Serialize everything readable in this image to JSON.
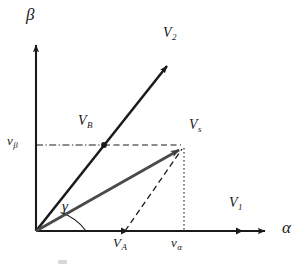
{
  "figure": {
    "kind": "space-vector-diagram",
    "background_color": "#ffffff",
    "ink_color": "#1a1a1a",
    "resultant_vector_color": "#4a4a4a"
  },
  "axes": {
    "horizontal": {
      "name": "alpha-axis",
      "label": "α",
      "origin": [
        36,
        231
      ],
      "arrow_tip": [
        272,
        231
      ],
      "label_pos": [
        282,
        222
      ]
    },
    "vertical": {
      "name": "beta-axis",
      "label": "β",
      "origin": [
        36,
        231
      ],
      "arrow_tip": [
        36,
        38
      ],
      "label_pos": [
        27,
        8
      ]
    }
  },
  "vectors": [
    {
      "name": "V2",
      "label": "V",
      "subscript": "2",
      "from": [
        36,
        231
      ],
      "to": [
        170,
        62
      ],
      "style": "solid-arrow",
      "label_pos": [
        168,
        30
      ]
    },
    {
      "name": "Vs",
      "label": "V",
      "subscript": "s",
      "from": [
        36,
        231
      ],
      "to": [
        184,
        147
      ],
      "style": "solid-arrow-gray",
      "label_pos": [
        191,
        122
      ]
    }
  ],
  "axis_markers": [
    {
      "name": "V1",
      "label": "V",
      "subscript": "1",
      "tick_pos": [
        240,
        231
      ],
      "label_pos": [
        231,
        199
      ],
      "axis": "alpha"
    },
    {
      "name": "VA",
      "label": "V",
      "subscript": "A",
      "tick_pos": [
        125,
        231
      ],
      "label_pos": [
        116,
        239
      ],
      "axis": "alpha"
    },
    {
      "name": "v-alpha",
      "label": "v",
      "subscript": "α",
      "tick_pos": [
        184,
        231
      ],
      "label_pos": [
        173,
        239
      ],
      "axis": "alpha"
    },
    {
      "name": "v-beta",
      "label": "v",
      "subscript": "β",
      "tick_pos": [
        36,
        145
      ],
      "label_pos": [
        8,
        136
      ],
      "axis": "beta"
    },
    {
      "name": "VB",
      "label": "V",
      "subscript": "B",
      "tick_pos": [
        104,
        145
      ],
      "label_pos": [
        80,
        119
      ],
      "axis": "V2"
    }
  ],
  "angle": {
    "name": "gamma",
    "label": "γ",
    "label_pos": [
      64,
      206
    ],
    "vertex": [
      36,
      231
    ],
    "from_axis": "alpha",
    "to_vector": "Vs"
  },
  "construction_lines": [
    {
      "name": "vbeta-to-VB",
      "style": "dash-dot",
      "from": [
        36,
        145
      ],
      "to": [
        104,
        145
      ]
    },
    {
      "name": "VB-to-Vs",
      "style": "dashed",
      "from": [
        104,
        145
      ],
      "to": [
        184,
        145
      ]
    },
    {
      "name": "VA-to-Vs",
      "style": "dashed",
      "from": [
        125,
        231
      ],
      "to": [
        184,
        147
      ]
    },
    {
      "name": "Vs-to-valpha",
      "style": "dotted",
      "from": [
        184,
        147
      ],
      "to": [
        184,
        231
      ]
    }
  ]
}
